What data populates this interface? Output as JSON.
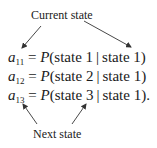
{
  "labels": {
    "top": "Current state",
    "bottom": "Next state"
  },
  "equations": [
    {
      "var": "a",
      "sub": "11",
      "eq": "=",
      "func": "P",
      "open": "(",
      "arg1": "state 1",
      "bar": "|",
      "arg2": "state 1",
      "close": ")"
    },
    {
      "var": "a",
      "sub": "12",
      "eq": "=",
      "func": "P",
      "open": "(",
      "arg1": "state 2",
      "bar": "|",
      "arg2": "state 1",
      "close": ")"
    },
    {
      "var": "a",
      "sub": "13",
      "eq": "=",
      "func": "P",
      "open": "(",
      "arg1": "state 3",
      "bar": "|",
      "arg2": "state 1",
      "close": ")."
    }
  ],
  "colors": {
    "text": "#1a1a1a",
    "arrow": "#333333",
    "background": "#ffffff"
  }
}
